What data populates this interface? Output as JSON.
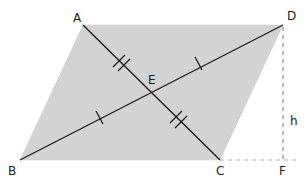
{
  "figure": {
    "type": "parallelogram-diagonals",
    "colors": {
      "fill": "#d3d3d3",
      "stroke": "#1e1e1e",
      "dashed": "#9a9a9a",
      "label": "#222222",
      "background": "#ffffff"
    },
    "points": {
      "A": {
        "label": "A",
        "x": 83,
        "y": 25
      },
      "B": {
        "label": "B",
        "x": 20,
        "y": 160
      },
      "C": {
        "label": "C",
        "x": 220,
        "y": 160
      },
      "D": {
        "label": "D",
        "x": 283,
        "y": 25
      },
      "E": {
        "label": "E",
        "x": 151.5,
        "y": 92.5
      },
      "F": {
        "label": "F",
        "x": 283,
        "y": 160
      }
    },
    "labels": {
      "A": "A",
      "B": "B",
      "C": "C",
      "D": "D",
      "E": "E",
      "F": "F",
      "height": "h"
    },
    "segments": [
      {
        "name": "diagonal-AC",
        "from": "A",
        "to": "C",
        "style": "solid"
      },
      {
        "name": "diagonal-BD",
        "from": "B",
        "to": "D",
        "style": "solid"
      },
      {
        "name": "height-DF",
        "from": "D",
        "to": "F",
        "style": "dashed"
      },
      {
        "name": "extension-CF",
        "from": "C",
        "to": "F",
        "style": "dashed"
      }
    ],
    "tick_marks": {
      "AE": 2,
      "EC": 2,
      "BE": 1,
      "ED": 1
    }
  }
}
